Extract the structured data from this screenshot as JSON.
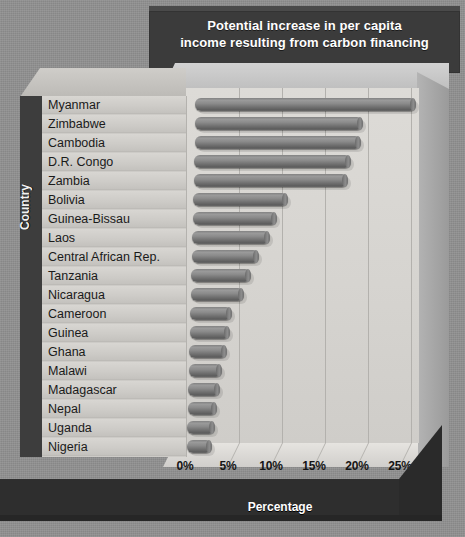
{
  "chart_data": {
    "type": "bar",
    "orientation": "horizontal",
    "title": "Potential increase in per capita income resulting from carbon financing",
    "title_line1": "Potential increase in per capita",
    "title_line2": "income resulting from carbon financing",
    "xlabel": "Percentage",
    "ylabel": "Country",
    "xlim": [
      0,
      27.5
    ],
    "xticks": [
      0,
      5,
      10,
      15,
      20,
      25
    ],
    "xtick_labels": [
      "0%",
      "5%",
      "10%",
      "15%",
      "20%",
      "25%"
    ],
    "grid": true,
    "legend": null,
    "style": "3d-cylinder-bars",
    "categories": [
      "Myanmar",
      "Zimbabwe",
      "Cambodia",
      "D.R. Congo",
      "Zambia",
      "Bolivia",
      "Guinea-Bissau",
      "Laos",
      "Central African Rep.",
      "Tanzania",
      "Nicaragua",
      "Cameroon",
      "Guinea",
      "Ghana",
      "Malawi",
      "Madagascar",
      "Nepal",
      "Uganda",
      "Nigeria"
    ],
    "values": [
      25.6,
      19.5,
      19.4,
      18.2,
      18.0,
      11.0,
      9.8,
      9.0,
      7.8,
      7.0,
      6.2,
      4.8,
      4.7,
      4.4,
      3.9,
      3.7,
      3.4,
      3.2,
      2.9
    ]
  },
  "colors": {
    "background": "#919191",
    "title_banner": "#3b3b3b",
    "title_text": "#ffffff",
    "plot_wall": "#d8d6d2",
    "bar_fill": "#7d7d7d",
    "label_panel": "#cdcbc7",
    "plinth": "#2e2e2e"
  }
}
